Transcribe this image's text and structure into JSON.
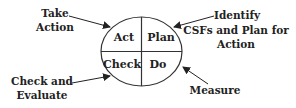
{
  "diagram": {
    "type": "PDCA cycle",
    "quadrants": {
      "act": "Act",
      "plan": "Plan",
      "check": "Check",
      "do": "Do"
    },
    "annotations": {
      "act": [
        "Take",
        "Action"
      ],
      "plan": [
        "Identify",
        "CSFs and Plan for",
        "Action"
      ],
      "check": [
        "Check and",
        "Evaluate"
      ],
      "do": [
        "Measure"
      ]
    },
    "colors": {
      "stroke": "#333333",
      "text": "#222222",
      "background": "#ffffff"
    }
  }
}
